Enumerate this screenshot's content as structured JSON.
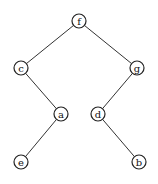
{
  "diagram": {
    "type": "binary-tree",
    "nodes": [
      {
        "id": "f",
        "label": "f",
        "x": 79,
        "y": 21
      },
      {
        "id": "c",
        "label": "c",
        "x": 21,
        "y": 68
      },
      {
        "id": "g",
        "label": "g",
        "x": 137,
        "y": 68
      },
      {
        "id": "a",
        "label": "a",
        "x": 61,
        "y": 114
      },
      {
        "id": "d",
        "label": "d",
        "x": 98,
        "y": 114
      },
      {
        "id": "e",
        "label": "e",
        "x": 21,
        "y": 162
      },
      {
        "id": "b",
        "label": "b",
        "x": 139,
        "y": 162
      }
    ],
    "edges": [
      {
        "from": "f",
        "to": "c"
      },
      {
        "from": "f",
        "to": "g"
      },
      {
        "from": "c",
        "to": "a"
      },
      {
        "from": "g",
        "to": "d"
      },
      {
        "from": "a",
        "to": "e"
      },
      {
        "from": "d",
        "to": "b"
      }
    ],
    "node_radius": 7
  }
}
